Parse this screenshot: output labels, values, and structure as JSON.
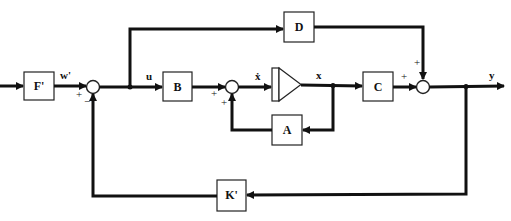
{
  "blocks": {
    "F": "F'",
    "B": "B",
    "D": "D",
    "C": "C",
    "A": "A",
    "K": "K'"
  },
  "signals": {
    "w": "w'",
    "u": "u",
    "xdot": "ẋ",
    "x": "x",
    "y": "y"
  },
  "signs": {
    "sum1_in": "+",
    "sum1_fb": "−",
    "sum2_in": "+",
    "sum2_fb": "+",
    "sum3_in": "+",
    "sum3_top": "+"
  },
  "colors": {
    "line": "#111111",
    "background": "#ffffff"
  }
}
